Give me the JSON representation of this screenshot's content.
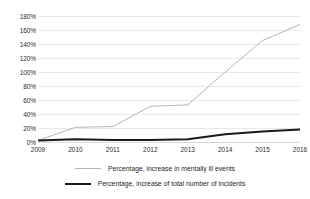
{
  "chart_data": {
    "type": "line",
    "title": "",
    "xlabel": "",
    "ylabel": "",
    "categories": [
      "2009",
      "2010",
      "2011",
      "2012",
      "2013",
      "2014",
      "2015",
      "2016"
    ],
    "ylim": [
      0,
      180
    ],
    "ytick_step": 20,
    "ytick_labels": [
      "180%",
      "160%",
      "140%",
      "120%",
      "100%",
      "80%",
      "60%",
      "40%",
      "20%",
      "0%"
    ],
    "ytick_values": [
      180,
      160,
      140,
      120,
      100,
      80,
      60,
      40,
      20,
      0
    ],
    "grid": true,
    "grid_axis": "y",
    "legend_position": "bottom",
    "series": [
      {
        "name": "Percentage, increase in mentally ill events",
        "color": "#b4b4b4",
        "width": 1,
        "values": [
          2,
          21,
          22,
          51,
          53,
          100,
          145,
          168
        ]
      },
      {
        "name": "Percentage, increase of total number of incidents",
        "color": "#1a1a1a",
        "width": 2,
        "values": [
          2,
          4,
          3,
          3,
          4,
          11,
          15,
          18
        ]
      }
    ]
  },
  "legend": {
    "items": [
      {
        "label": "Percentage, increase in mentally ill events"
      },
      {
        "label": "Percentage, increase of total number of incidents"
      }
    ]
  }
}
